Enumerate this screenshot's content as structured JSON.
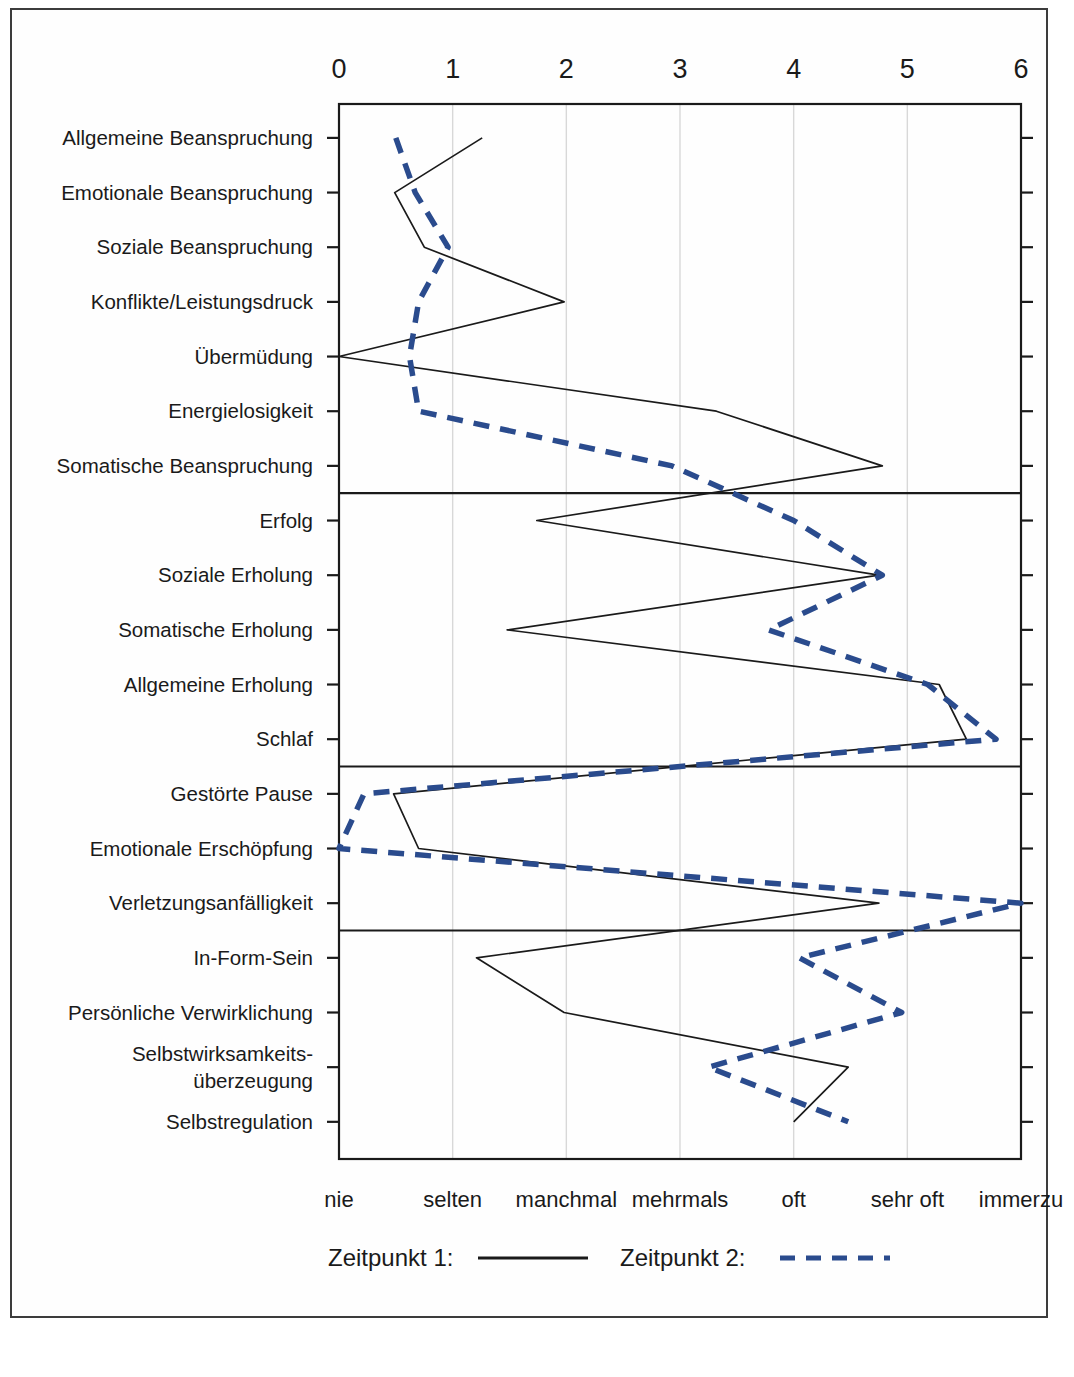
{
  "chart_data": {
    "type": "line",
    "title": "",
    "xlabel": "",
    "ylabel": "",
    "xlim": [
      0,
      6
    ],
    "xticks": [
      0,
      1,
      2,
      3,
      4,
      5,
      6
    ],
    "xtick_labels": [
      "0",
      "1",
      "2",
      "3",
      "4",
      "5",
      "6"
    ],
    "anchor_labels": [
      "nie",
      "selten",
      "manchmal",
      "mehrmals",
      "oft",
      "sehr oft",
      "immerzu"
    ],
    "grid": true,
    "orientation": "horizontal-categories",
    "legend_position": "bottom",
    "categories": [
      "Allgemeine Beanspruchung",
      "Emotionale Beanspruchung",
      "Soziale Beanspruchung",
      "Konflikte/Leistungsdruck",
      "Übermüdung",
      "Energielosigkeit",
      "Somatische Beanspruchung",
      "Erfolg",
      "Soziale Erholung",
      "Somatische Erholung",
      "Allgemeine Erholung",
      "Schlaf",
      "Gestörte Pause",
      "Emotionale Erschöpfung",
      "Verletzungsanfälligkeit",
      "In-Form-Sein",
      "Persönliche Verwirklichung",
      "Selbstwirksamkeits-\núberzeugung",
      "Selbstregulation"
    ],
    "category_lines": [
      [
        "Allgemeine Beanspruchung"
      ],
      [
        "Emotionale Beanspruchung"
      ],
      [
        "Soziale Beanspruchung"
      ],
      [
        "Konflikte/Leistungsdruck"
      ],
      [
        "Übermüdung"
      ],
      [
        "Energielosigkeit"
      ],
      [
        "Somatische Beanspruchung"
      ],
      [
        "Erfolg"
      ],
      [
        "Soziale Erholung"
      ],
      [
        "Somatische Erholung"
      ],
      [
        "Allgemeine Erholung"
      ],
      [
        "Schlaf"
      ],
      [
        "Gestörte Pause"
      ],
      [
        "Emotionale Erschöpfung"
      ],
      [
        "Verletzungsanfälligkeit"
      ],
      [
        "In-Form-Sein"
      ],
      [
        "Persönliche Verwirklichung"
      ],
      [
        "Selbstwirksamkeits-",
        "überzeugung"
      ],
      [
        "Selbstregulation"
      ]
    ],
    "series": [
      {
        "name": "Zeitpunkt 1:",
        "style": "solid",
        "color": "#1a1a1a",
        "values": [
          1.26,
          0.49,
          0.75,
          1.98,
          0.0,
          3.32,
          4.78,
          1.74,
          4.75,
          1.48,
          5.28,
          5.52,
          0.48,
          0.7,
          4.75,
          1.21,
          1.98,
          4.48,
          4.0
        ]
      },
      {
        "name": "Zeitpunkt 2:",
        "style": "dashed",
        "color": "#2a4b8d",
        "values": [
          0.5,
          0.67,
          0.96,
          0.7,
          0.62,
          0.7,
          2.93,
          4.0,
          4.78,
          3.78,
          5.18,
          5.78,
          0.22,
          0.0,
          6.0,
          4.05,
          4.95,
          3.25,
          4.48
        ]
      }
    ],
    "section_dividers_after": [
      7,
      12,
      15
    ]
  },
  "legend": {
    "entries": [
      {
        "label": "Zeitpunkt 1:",
        "style": "solid",
        "color": "#1a1a1a"
      },
      {
        "label": "Zeitpunkt 2:",
        "style": "dashed",
        "color": "#2a4b8d"
      }
    ]
  },
  "colors": {
    "series1": "#1a1a1a",
    "series2": "#2a4b8d",
    "axis": "#1a1a1a",
    "grid": "#d8d8d8",
    "page_border": "#3c3c3c"
  }
}
